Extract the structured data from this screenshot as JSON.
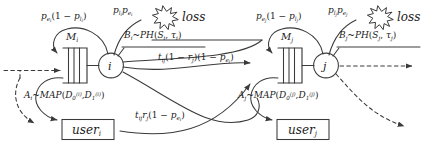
{
  "diagram": {
    "colors": {
      "stroke": "#3a3a3a",
      "text": "#1d1d1d",
      "background": "#ffffff"
    },
    "nodes": [
      {
        "id": "i",
        "label": "i",
        "queue_label": "M",
        "queue_sub": "i"
      },
      {
        "id": "j",
        "label": "j",
        "queue_label": "M",
        "queue_sub": "j"
      }
    ],
    "users": [
      {
        "id": "user_i",
        "text": "user",
        "sub": "i"
      },
      {
        "id": "user_j",
        "text": "user",
        "sub": "j"
      }
    ],
    "loss": [
      {
        "id": "loss_i",
        "text": "loss"
      },
      {
        "id": "loss_j",
        "text": "loss"
      }
    ],
    "labels": {
      "feedback_i": {
        "lead": "p",
        "lead_sub": "e",
        "lead_sub2": "i",
        "full": "pe_i(1 - pl_i)"
      },
      "feedback_j": {
        "lead": "p",
        "lead_sub": "e",
        "lead_sub2": "j",
        "full": "pe_j(1 - pl_j)"
      },
      "loss_rate_i": "pl_i pe_i",
      "loss_rate_j": "pl_j pe_j",
      "service_i": "B_i ~ PH(S_i, tau_i)",
      "service_j": "B_j ~ PH(S_j, tau_j)",
      "route_top": "t_ij (1 - r_j)(1 - pe_i)",
      "route_bottom": "t_ij r_j (1 - pe_i)",
      "arrival_i": "A_i ~ MAP(D_0^(i), D_1^(i))",
      "arrival_j": "A_j ~ MAP(D_0^(j), D_1^(j))"
    }
  }
}
